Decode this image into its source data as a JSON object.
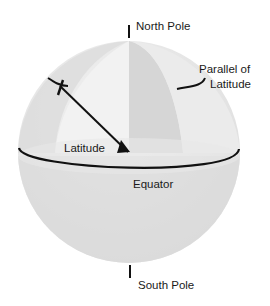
{
  "diagram": {
    "labels": {
      "north_pole": "North Pole",
      "south_pole": "South Pole",
      "parallel_line1": "Parallel of",
      "parallel_line2": "Latitude",
      "latitude_angle": "Latitude",
      "equator": "Equator"
    },
    "colors": {
      "background": "#ffffff",
      "sphere_light": "#ececec",
      "sphere_mid": "#e0e0e0",
      "sphere_dark": "#d2d2d2",
      "lines": "#111111"
    }
  }
}
